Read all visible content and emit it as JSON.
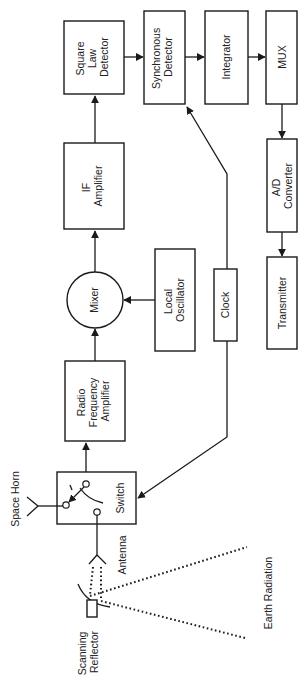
{
  "diagram": {
    "type": "block-diagram",
    "orientation": "rotated-90-cw",
    "blocks": {
      "square_law": {
        "lines": [
          "Square",
          "Law",
          "Detector"
        ]
      },
      "synchronous": {
        "lines": [
          "Synchronous",
          "Detector"
        ]
      },
      "integrator": {
        "lines": [
          "Integrator"
        ]
      },
      "mux": {
        "lines": [
          "MUX"
        ]
      },
      "if_amp": {
        "lines": [
          "IF",
          "Amplifier"
        ]
      },
      "ad_conv": {
        "lines": [
          "A/D",
          "Converter"
        ]
      },
      "transmitter": {
        "lines": [
          "Transmitter"
        ]
      },
      "mixer": {
        "lines": [
          "Mixer"
        ]
      },
      "local_osc": {
        "lines": [
          "Local",
          "Oscillator"
        ]
      },
      "clock": {
        "lines": [
          "Clock"
        ]
      },
      "rf_amp": {
        "lines": [
          "Radio",
          "Frequency",
          "Amplifier"
        ]
      },
      "switch": {
        "lines": [
          "Switch"
        ]
      }
    },
    "labels": {
      "space_horn": "Space Horn",
      "antenna": "Antenna",
      "scanning_reflector": [
        "Scanning",
        "Reflector"
      ],
      "earth_radiation": "Earth Radiation"
    },
    "connections": [
      {
        "from": "Scanning Reflector",
        "to": "Antenna",
        "style": "dotted"
      },
      {
        "from": "Space Horn",
        "to": "Switch"
      },
      {
        "from": "Antenna",
        "to": "Switch"
      },
      {
        "from": "Switch",
        "to": "Radio Frequency Amplifier"
      },
      {
        "from": "Radio Frequency Amplifier",
        "to": "Mixer"
      },
      {
        "from": "Local Oscillator",
        "to": "Mixer"
      },
      {
        "from": "Mixer",
        "to": "IF Amplifier"
      },
      {
        "from": "IF Amplifier",
        "to": "Square Law Detector"
      },
      {
        "from": "Square Law Detector",
        "to": "Synchronous Detector"
      },
      {
        "from": "Clock",
        "to": "Synchronous Detector"
      },
      {
        "from": "Clock",
        "to": "Switch"
      },
      {
        "from": "Synchronous Detector",
        "to": "Integrator"
      },
      {
        "from": "Integrator",
        "to": "MUX"
      },
      {
        "from": "MUX",
        "to": "A/D Converter"
      },
      {
        "from": "A/D Converter",
        "to": "Transmitter"
      }
    ]
  }
}
